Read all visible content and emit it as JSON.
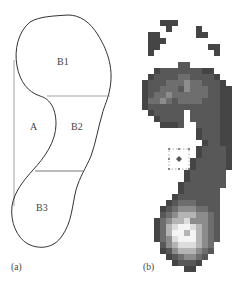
{
  "figure_a": {
    "panel_label": "(a)",
    "regions": [
      {
        "id": "B1",
        "label": "B1"
      },
      {
        "id": "A",
        "label": "A"
      },
      {
        "id": "B2",
        "label": "B2"
      },
      {
        "id": "B3",
        "label": "B3"
      }
    ]
  },
  "figure_b": {
    "panel_label": "(b)",
    "description": "plantar pressure map (grayscale)",
    "grid": {
      "cols": 15,
      "cell_px": 6,
      "rows": [
        "000000000000000",
        "000111000000000",
        "000010000100000",
        "011000000110000",
        "011100000000000",
        "011000000001100",
        "010000000000100",
        "000000000000000",
        "000000220000000",
        "001222222211000",
        "012222332222100",
        "122233343322210",
        "122333243332211",
        "123343333332211",
        "133432333322211",
        "122222222222211",
        "012222202222211",
        "001222202222211",
        "000111200222211",
        "000000000122211",
        "000000000122211",
        "000000000012211",
        "000000000122221",
        "000000000122221",
        "000000001222221",
        "000000001222221",
        "000000012222220",
        "000000012222220",
        "000000122222220",
        "000000122222200",
        "000001222222200",
        "000012333222200",
        "000123444332200",
        "000234555443200",
        "001345564443200",
        "001356776543200",
        "001357757543200",
        "001346777543200",
        "000245666543000",
        "000124555432000",
        "000012344320000",
        "000001222100000",
        "000000011000000"
      ]
    }
  }
}
